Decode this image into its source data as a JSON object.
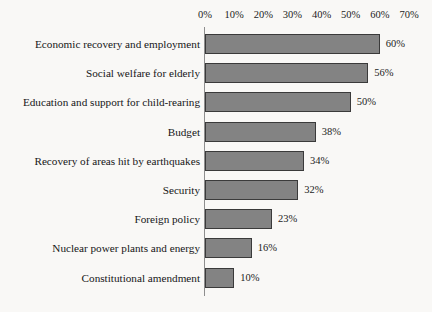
{
  "chart_data": {
    "type": "bar",
    "orientation": "horizontal",
    "title": "",
    "subtitle": "",
    "xlabel": "",
    "ylabel": "",
    "xlim": [
      0,
      70
    ],
    "grid": false,
    "legend": null,
    "value_suffix": "%",
    "x_ticks": [
      {
        "value": 0,
        "label": "0%"
      },
      {
        "value": 10,
        "label": "10%"
      },
      {
        "value": 20,
        "label": "20%"
      },
      {
        "value": 30,
        "label": "30%"
      },
      {
        "value": 40,
        "label": "40%"
      },
      {
        "value": 50,
        "label": "50%"
      },
      {
        "value": 60,
        "label": "60%"
      },
      {
        "value": 70,
        "label": "70%"
      }
    ],
    "categories": [
      "Economic recovery and employment",
      "Social welfare for elderly",
      "Education and support for child-rearing",
      "Budget",
      "Recovery of areas hit by earthquakes",
      "Security",
      "Foreign policy",
      "Nuclear power plants and energy",
      "Constitutional amendment"
    ],
    "values": [
      60,
      56,
      50,
      38,
      34,
      32,
      23,
      16,
      10
    ],
    "data_labels": [
      "60%",
      "56%",
      "50%",
      "38%",
      "34%",
      "32%",
      "23%",
      "16%",
      "10%"
    ],
    "colors": {
      "bar_fill": "#838383",
      "bar_border": "#3a3a3a",
      "axis_line": "#8e8e8e",
      "background": "#f9f8f6",
      "text": "#1a1a1a"
    }
  }
}
